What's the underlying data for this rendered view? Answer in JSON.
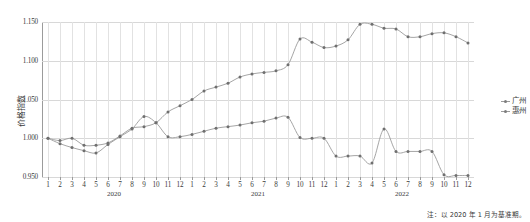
{
  "chart_data": {
    "type": "line",
    "title": "",
    "xlabel": "",
    "ylabel": "价格指数",
    "ylim": [
      0.95,
      1.15
    ],
    "yticks": [
      0.95,
      1.0,
      1.05,
      1.1,
      1.15
    ],
    "ytick_labels": [
      "0.950",
      "1.000",
      "1.050",
      "1.100",
      "1.150"
    ],
    "grid": true,
    "legend_position": "right",
    "note": "注：以 2020 年 1 月为基准期。",
    "years": [
      {
        "label": "2020",
        "start_index": 0,
        "end_index": 11
      },
      {
        "label": "2021",
        "start_index": 12,
        "end_index": 23
      },
      {
        "label": "2022",
        "start_index": 24,
        "end_index": 35
      }
    ],
    "categories": [
      "1",
      "2",
      "3",
      "4",
      "5",
      "6",
      "7",
      "8",
      "9",
      "10",
      "11",
      "12",
      "1",
      "2",
      "3",
      "4",
      "5",
      "6",
      "7",
      "8",
      "9",
      "10",
      "11",
      "12",
      "1",
      "2",
      "3",
      "4",
      "5",
      "6",
      "7",
      "8",
      "9",
      "10",
      "11",
      "12"
    ],
    "series": [
      {
        "name": "广州",
        "color": "#9b9b9b",
        "values": [
          1.0,
          0.997,
          1.0,
          0.991,
          0.991,
          0.994,
          1.003,
          1.013,
          1.015,
          1.02,
          1.034,
          1.042,
          1.05,
          1.061,
          1.066,
          1.071,
          1.079,
          1.083,
          1.085,
          1.087,
          1.095,
          1.128,
          1.124,
          1.117,
          1.119,
          1.127,
          1.147,
          1.147,
          1.142,
          1.141,
          1.131,
          1.131,
          1.135,
          1.136,
          1.131,
          1.123
        ]
      },
      {
        "name": "惠州",
        "color": "#9b9b9b",
        "values": [
          1.0,
          0.993,
          0.988,
          0.984,
          0.981,
          0.992,
          1.002,
          1.012,
          1.028,
          1.02,
          1.002,
          1.002,
          1.005,
          1.009,
          1.013,
          1.015,
          1.017,
          1.02,
          1.022,
          1.026,
          1.027,
          1.001,
          1.0,
          1.0,
          0.977,
          0.977,
          0.977,
          0.968,
          1.012,
          0.983,
          0.983,
          0.983,
          0.983,
          0.953,
          0.952,
          0.952
        ]
      }
    ]
  }
}
